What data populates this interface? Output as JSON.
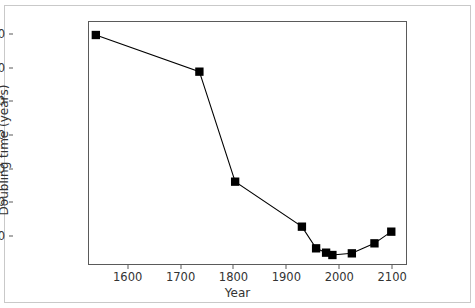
{
  "chart_data": {
    "type": "line",
    "title": "",
    "xlabel": "Year",
    "ylabel": "Doubling time (years)",
    "xlim": [
      1525,
      2128
    ],
    "ylim": [
      13,
      739
    ],
    "grid": false,
    "legend": null,
    "marker": "square",
    "marker_color": "#000000",
    "line_color": "#000000",
    "xticks": [
      1600,
      1700,
      1800,
      1900,
      2000,
      2100
    ],
    "xticklabels": [
      "1600",
      "1700",
      "1800",
      "1900",
      "2000",
      "2100"
    ],
    "yticks": [
      100,
      200,
      300,
      400,
      500,
      600,
      700
    ],
    "yticklabels": [
      "100",
      "200",
      "300",
      "400",
      "500",
      "600",
      "700"
    ],
    "series": [
      {
        "name": "Doubling time",
        "x": [
          1538,
          1735,
          1803,
          1930,
          1957,
          1976,
          1988,
          2025,
          2068,
          2100
        ],
        "y": [
          700,
          590,
          260,
          125,
          60,
          47,
          40,
          45,
          75,
          110
        ]
      }
    ]
  }
}
